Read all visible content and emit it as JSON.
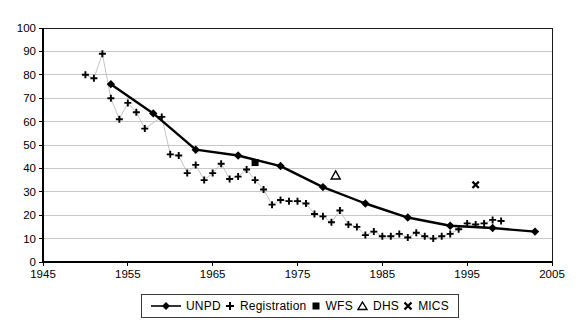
{
  "chart_data": {
    "type": "line",
    "title": "",
    "xlabel": "",
    "ylabel": "",
    "xlim": [
      1945,
      2005
    ],
    "ylim": [
      0,
      100
    ],
    "x_ticks": [
      1945,
      1955,
      1965,
      1975,
      1985,
      1995,
      2005
    ],
    "y_ticks": [
      0,
      10,
      20,
      30,
      40,
      50,
      60,
      70,
      80,
      90,
      100
    ],
    "grid": "horizontal",
    "grid_color": "#c8c8c8",
    "axis_color": "#1a1a1a",
    "legend_position": "bottom",
    "series": [
      {
        "name": "UNPD",
        "marker": "diamond-filled",
        "draw_line": true,
        "line_width": 2.4,
        "line_color": "#000000",
        "points": [
          [
            1953,
            76
          ],
          [
            1958,
            63.5
          ],
          [
            1963,
            48
          ],
          [
            1968,
            45.5
          ],
          [
            1973,
            41
          ],
          [
            1978,
            32
          ],
          [
            1983,
            25
          ],
          [
            1988,
            19
          ],
          [
            1993,
            15.5
          ],
          [
            1998,
            14.5
          ],
          [
            2003,
            13
          ]
        ]
      },
      {
        "name": "Registration",
        "marker": "plus",
        "draw_line": true,
        "line_width": 0.8,
        "line_color": "#b4b4b4",
        "points": [
          [
            1950,
            80
          ],
          [
            1951,
            78.5
          ],
          [
            1952,
            89
          ],
          [
            1953,
            70
          ],
          [
            1954,
            61
          ],
          [
            1955,
            68
          ],
          [
            1956,
            64
          ],
          [
            1957,
            57
          ],
          [
            1959,
            62
          ],
          [
            1960,
            46
          ],
          [
            1961,
            45.5
          ],
          [
            1962,
            38
          ],
          [
            1963,
            41.5
          ],
          [
            1964,
            35
          ],
          [
            1965,
            38
          ],
          [
            1966,
            42
          ],
          [
            1967,
            35.5
          ],
          [
            1968,
            36.5
          ],
          [
            1969,
            39.5
          ],
          [
            1970,
            35
          ],
          [
            1971,
            31
          ],
          [
            1972,
            24.5
          ],
          [
            1973,
            26.5
          ],
          [
            1974,
            26
          ],
          [
            1975,
            26
          ],
          [
            1976,
            25
          ],
          [
            1977,
            20.5
          ],
          [
            1978,
            19.5
          ],
          [
            1979,
            17
          ],
          [
            1980,
            22
          ],
          [
            1981,
            16
          ],
          [
            1982,
            15
          ],
          [
            1983,
            11.5
          ],
          [
            1984,
            13
          ],
          [
            1985,
            11
          ],
          [
            1986,
            11
          ],
          [
            1987,
            12
          ],
          [
            1988,
            10.5
          ],
          [
            1989,
            12.5
          ],
          [
            1990,
            11
          ],
          [
            1991,
            10
          ],
          [
            1992,
            11
          ],
          [
            1993,
            12
          ],
          [
            1994,
            14
          ],
          [
            1995,
            16.5
          ],
          [
            1996,
            16
          ],
          [
            1997,
            16.5
          ],
          [
            1998,
            18
          ],
          [
            1999,
            17.5
          ]
        ]
      },
      {
        "name": "WFS",
        "marker": "square-filled",
        "draw_line": false,
        "points": [
          [
            1970,
            42.5
          ]
        ]
      },
      {
        "name": "DHS",
        "marker": "triangle-open",
        "draw_line": false,
        "points": [
          [
            1979.5,
            37
          ]
        ]
      },
      {
        "name": "MICS",
        "marker": "x-bold",
        "draw_line": false,
        "points": [
          [
            1996,
            33
          ]
        ]
      }
    ]
  },
  "colors": {
    "foreground": "#000000",
    "background": "#ffffff",
    "gridline": "#c8c8c8"
  }
}
